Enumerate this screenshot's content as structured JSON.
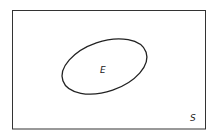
{
  "diagram": {
    "type": "venn",
    "universe": {
      "label": "S"
    },
    "sets": [
      {
        "label": "E"
      }
    ],
    "colors": {
      "stroke": "#222222",
      "background": "#ffffff"
    }
  }
}
